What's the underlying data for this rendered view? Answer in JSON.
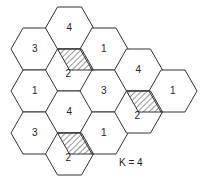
{
  "diagram": {
    "cluster_label": "K = 4",
    "hex_side": 24,
    "hex_half_height": 21,
    "stroke_color": "#333333",
    "cells": [
      {
        "label": "3",
        "cx": 35,
        "cy": 49,
        "hatched": false
      },
      {
        "label": "1",
        "cx": 35,
        "cy": 91,
        "hatched": false
      },
      {
        "label": "3",
        "cx": 35,
        "cy": 133,
        "hatched": false
      },
      {
        "label": "4",
        "cx": 69.5,
        "cy": 28,
        "hatched": false
      },
      {
        "label": "2",
        "cx": 69.5,
        "cy": 70,
        "hatched": true
      },
      {
        "label": "4",
        "cx": 69.5,
        "cy": 112,
        "hatched": false
      },
      {
        "label": "2",
        "cx": 69.5,
        "cy": 154,
        "hatched": true
      },
      {
        "label": "1",
        "cx": 104,
        "cy": 49,
        "hatched": false
      },
      {
        "label": "3",
        "cx": 104,
        "cy": 91,
        "hatched": false
      },
      {
        "label": "1",
        "cx": 104,
        "cy": 133,
        "hatched": false
      },
      {
        "label": "4",
        "cx": 138.5,
        "cy": 70,
        "hatched": false
      },
      {
        "label": "2",
        "cx": 138.5,
        "cy": 112,
        "hatched": true
      },
      {
        "label": "1",
        "cx": 173,
        "cy": 91,
        "hatched": false
      }
    ]
  }
}
